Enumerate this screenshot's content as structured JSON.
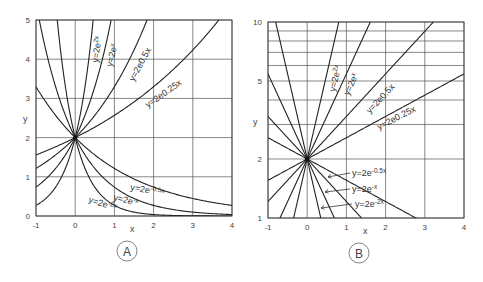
{
  "chart_data": [
    {
      "id": "A",
      "type": "line",
      "title": "A",
      "xlabel": "x",
      "ylabel": "y",
      "xlim": [
        -1,
        4
      ],
      "ylim": [
        0,
        5
      ],
      "yscale": "linear",
      "xticks": [
        "-1",
        "0",
        "1",
        "2",
        "3",
        "4"
      ],
      "yticks": [
        "0",
        "1",
        "2",
        "3",
        "4",
        "5"
      ],
      "grid": true,
      "function": "y = 2e^(kx)",
      "series": [
        {
          "name": "y=2e^2x",
          "k": 2
        },
        {
          "name": "y=2e^x",
          "k": 1
        },
        {
          "name": "y=2e^0.5x",
          "k": 0.5
        },
        {
          "name": "y=2e^0.25x",
          "k": 0.25
        },
        {
          "name": "y=2e^-0.5x",
          "k": -0.5
        },
        {
          "name": "y=2e^-x",
          "k": -1
        },
        {
          "name": "y=2e^-2x",
          "k": -2
        }
      ],
      "annotations": [
        "y=2e²ˣ",
        "y=2eˣ",
        "y=2e0.5x",
        "y=2e0.25x",
        "y=2e⁻⁰·⁵ˣ",
        "y=2e⁻ˣ",
        "y=2e⁻²ˣ"
      ]
    },
    {
      "id": "B",
      "type": "line",
      "title": "B",
      "xlabel": "x",
      "ylabel": "y",
      "xlim": [
        -1,
        4
      ],
      "ylim": [
        1,
        10
      ],
      "yscale": "log",
      "xticks": [
        "-1",
        "0",
        "1",
        "2",
        "3",
        "4"
      ],
      "yticks": [
        "1",
        "2",
        "5",
        "10"
      ],
      "grid": true,
      "function": "y = 2e^(kx)",
      "series": [
        {
          "name": "y=2e^2x",
          "k": 2
        },
        {
          "name": "y=2e^x",
          "k": 1
        },
        {
          "name": "y=2e^0.5x",
          "k": 0.5
        },
        {
          "name": "y=2e^0.25x",
          "k": 0.25
        },
        {
          "name": "y=2e^-0.25x",
          "k": -0.25
        },
        {
          "name": "y=2e^-0.5x",
          "k": -0.5
        },
        {
          "name": "y=2e^-x",
          "k": -1
        },
        {
          "name": "y=2e^-2x",
          "k": -2
        }
      ],
      "annotations": [
        "y=2e²ˣ",
        "y=2eˣ",
        "y=2e0.5x",
        "y=2e0.25x",
        "y=2e⁻⁰·⁵ˣ",
        "y=2e⁻ˣ",
        "y=2e⁻²ˣ"
      ]
    }
  ],
  "panels": {
    "A": {
      "label": "A",
      "ylabel": "y",
      "xlabel": "x",
      "labels": {
        "k2": "y=2e",
        "k2_sup": "2x",
        "k1": "y=2e",
        "k1_sup": "x",
        "k05": "y=2e0.5x",
        "k025": "y=2e0.25x",
        "km05": "y=2e",
        "km05_sup": "-0.5x",
        "km1": "y=2e",
        "km1_sup": "-x",
        "km2": "y=2e",
        "km2_sup": "-2x"
      }
    },
    "B": {
      "label": "B",
      "ylabel": "y",
      "xlabel": "x",
      "labels": {
        "k2": "y=2e",
        "k2_sup": "2x",
        "k1": "y=2e",
        "k1_sup": "x",
        "k05": "y=2e0.5x",
        "k025": "y=2e0.25x",
        "km05": "y=2e",
        "km05_sup": "-0.5x",
        "km1": "y=2e",
        "km1_sup": "-x",
        "km2": "y=2e",
        "km2_sup": "-2x"
      }
    }
  }
}
